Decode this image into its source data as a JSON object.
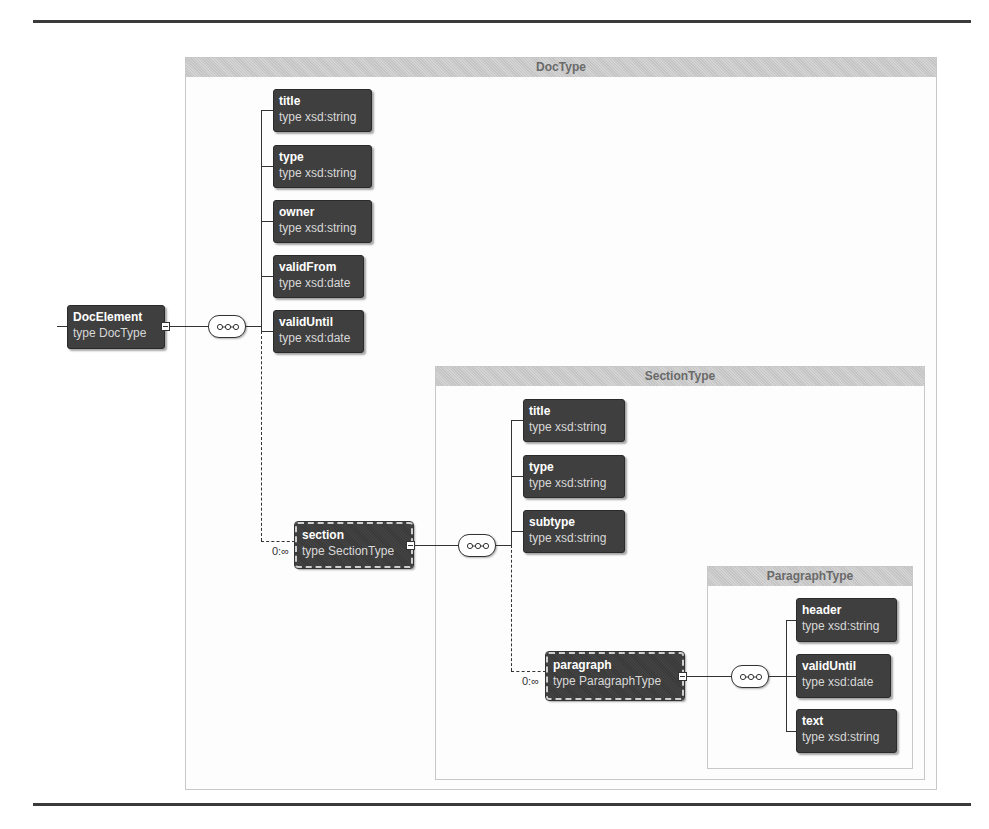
{
  "root": {
    "name": "DocElement",
    "type": "type DocType"
  },
  "doctype": {
    "title": "DocType",
    "elements": [
      {
        "name": "title",
        "type": "type xsd:string"
      },
      {
        "name": "type",
        "type": "type xsd:string"
      },
      {
        "name": "owner",
        "type": "type xsd:string"
      },
      {
        "name": "validFrom",
        "type": "type xsd:date"
      },
      {
        "name": "validUntil",
        "type": "type xsd:date"
      }
    ],
    "section": {
      "name": "section",
      "type": "type SectionType",
      "cardinality": "0:∞"
    }
  },
  "sectiontype": {
    "title": "SectionType",
    "elements": [
      {
        "name": "title",
        "type": "type xsd:string"
      },
      {
        "name": "type",
        "type": "type xsd:string"
      },
      {
        "name": "subtype",
        "type": "type xsd:string"
      }
    ],
    "paragraph": {
      "name": "paragraph",
      "type": "type ParagraphType",
      "cardinality": "0:∞"
    }
  },
  "paragraphtype": {
    "title": "ParagraphType",
    "elements": [
      {
        "name": "header",
        "type": "type xsd:string"
      },
      {
        "name": "validUntil",
        "type": "type xsd:date"
      },
      {
        "name": "text",
        "type": "type xsd:string"
      }
    ]
  }
}
